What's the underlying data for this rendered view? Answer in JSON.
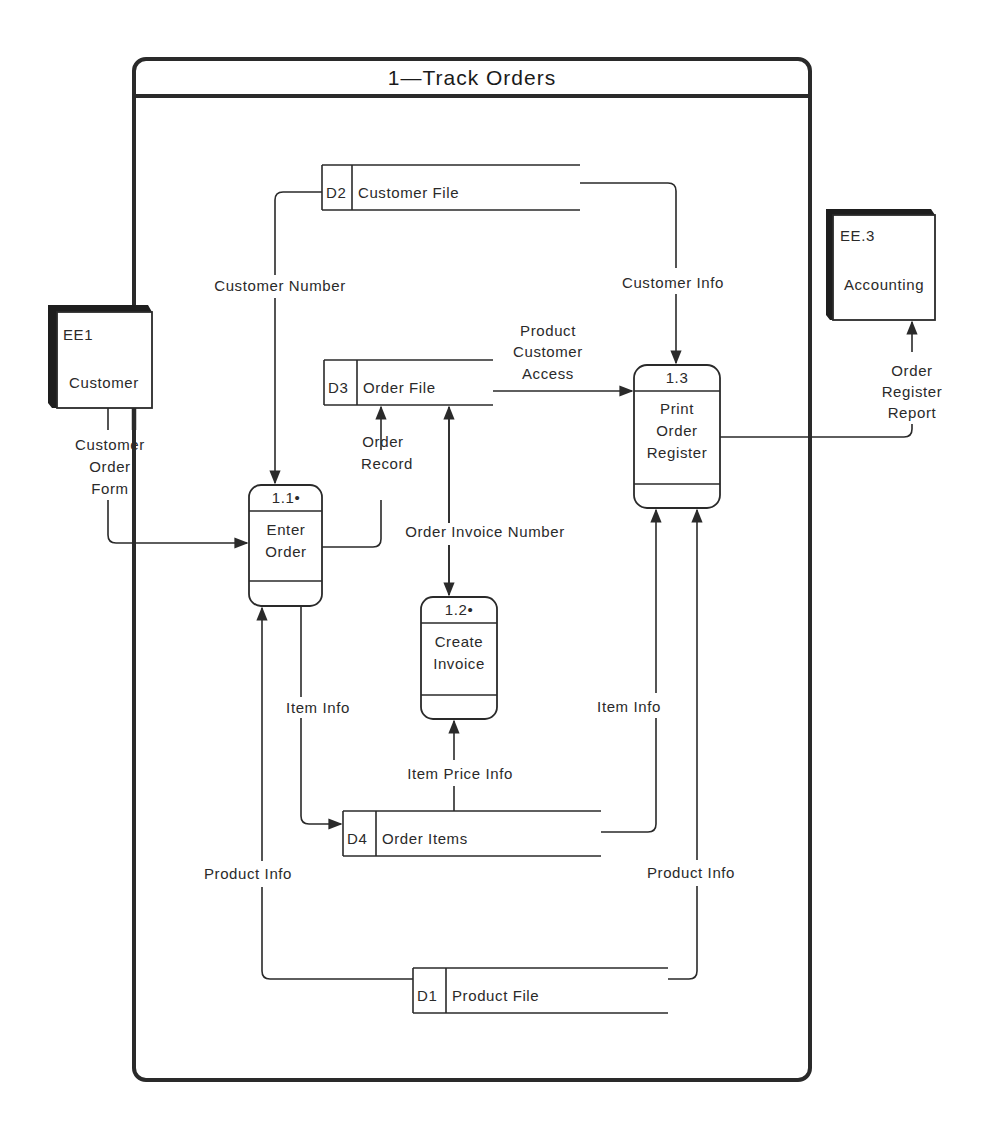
{
  "diagram": {
    "type": "data-flow-diagram",
    "title": "1—Track Orders",
    "colors": {
      "ink": "#2a2a2a",
      "background": "#ffffff"
    },
    "external_entities": [
      {
        "id": "EE1",
        "name": "Customer"
      },
      {
        "id": "EE.3",
        "name": "Accounting"
      }
    ],
    "processes": [
      {
        "id": "1.1•",
        "name_lines": [
          "Enter",
          "Order"
        ]
      },
      {
        "id": "1.2•",
        "name_lines": [
          "Create",
          "Invoice"
        ]
      },
      {
        "id": "1.3",
        "name_lines": [
          "Print",
          "Order",
          "Register"
        ]
      }
    ],
    "data_stores": [
      {
        "id": "D2",
        "name": "Customer File"
      },
      {
        "id": "D3",
        "name": "Order File"
      },
      {
        "id": "D4",
        "name": "Order Items"
      },
      {
        "id": "D1",
        "name": "Product File"
      }
    ],
    "flows": [
      {
        "label_lines": [
          "Customer",
          "Order",
          "Form"
        ],
        "from": "EE1",
        "to": "1.1"
      },
      {
        "label_lines": [
          "Customer Number"
        ],
        "from": "D2",
        "to": "1.1"
      },
      {
        "label_lines": [
          "Customer Info"
        ],
        "from": "D2",
        "to": "1.3"
      },
      {
        "label_lines": [
          "Order",
          "Record"
        ],
        "from": "1.1",
        "to": "D3"
      },
      {
        "label_lines": [
          "Order Invoice Number"
        ],
        "from": "D3",
        "to": "1.2",
        "bidirectional": true
      },
      {
        "label_lines": [
          "Product",
          "Customer",
          "Access"
        ],
        "from": "D3",
        "to": "1.3"
      },
      {
        "label_lines": [
          "Order",
          "Register",
          "Report"
        ],
        "from": "1.3",
        "to": "EE.3"
      },
      {
        "label_lines": [
          "Item Info"
        ],
        "from": "1.1",
        "to": "D4"
      },
      {
        "label_lines": [
          "Item Price Info"
        ],
        "from": "D4",
        "to": "1.2"
      },
      {
        "label_lines": [
          "Item Info"
        ],
        "from": "D4",
        "to": "1.3"
      },
      {
        "label_lines": [
          "Product Info"
        ],
        "from": "D1",
        "to": "1.1"
      },
      {
        "label_lines": [
          "Product Info"
        ],
        "from": "D1",
        "to": "1.3"
      }
    ]
  }
}
